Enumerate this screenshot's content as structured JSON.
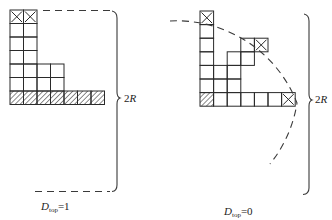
{
  "figure": {
    "left_panel": {
      "caption_symbol": "D",
      "caption_subscript": "top",
      "caption_value": "=1",
      "brace_label_number": "2",
      "brace_label_symbol": "R",
      "boundary_style": "dashed-rectangle-corner",
      "cells": {
        "cell_size_px": 13.5,
        "origin": [
          10,
          10
        ],
        "plain": [
          [
            0,
            1
          ],
          [
            1,
            1
          ],
          [
            0,
            2
          ],
          [
            1,
            2
          ],
          [
            0,
            3
          ],
          [
            1,
            3
          ],
          [
            0,
            4
          ],
          [
            1,
            4
          ],
          [
            2,
            4
          ],
          [
            3,
            4
          ],
          [
            0,
            5
          ],
          [
            1,
            5
          ],
          [
            2,
            5
          ],
          [
            3,
            5
          ]
        ],
        "crossed": [
          [
            0,
            0
          ],
          [
            1,
            0
          ]
        ],
        "hatched": [
          [
            0,
            6
          ],
          [
            1,
            6
          ],
          [
            2,
            6
          ],
          [
            3,
            6
          ],
          [
            4,
            6
          ],
          [
            5,
            6
          ],
          [
            6,
            6
          ]
        ]
      }
    },
    "right_panel": {
      "caption_symbol": "D",
      "caption_subscript": "top",
      "caption_value": "=0",
      "brace_label_number": "2",
      "brace_label_symbol": "R",
      "boundary_style": "dashed-quarter-circle",
      "cells": {
        "cell_size_px": 13.6,
        "origin": [
          200,
          11
        ],
        "plain": [
          [
            0,
            1
          ],
          [
            0,
            2
          ],
          [
            0,
            3
          ],
          [
            0,
            4
          ],
          [
            0,
            5
          ],
          [
            1,
            4
          ],
          [
            1,
            5
          ],
          [
            2,
            5
          ],
          [
            2,
            4
          ],
          [
            2,
            3
          ],
          [
            3,
            3
          ],
          [
            3,
            2
          ],
          [
            1,
            6
          ],
          [
            2,
            6
          ],
          [
            3,
            6
          ],
          [
            4,
            6
          ],
          [
            5,
            6
          ]
        ],
        "crossed": [
          [
            0,
            0
          ],
          [
            4,
            2
          ],
          [
            6,
            6
          ]
        ],
        "hatched": [
          [
            0,
            6
          ]
        ]
      }
    }
  },
  "colors": {
    "line": "#2a2a2a",
    "dash": "#3a3a3a",
    "background": "#ffffff"
  }
}
